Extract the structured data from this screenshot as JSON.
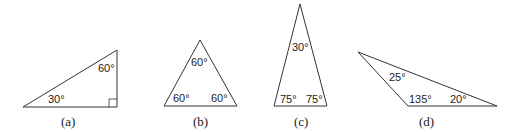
{
  "figures": [
    {
      "caption": "(a)",
      "angles": [
        "60°",
        "30°"
      ],
      "right_angle_marker": true
    },
    {
      "caption": "(b)",
      "angles": [
        "60°",
        "60°",
        "60°"
      ]
    },
    {
      "caption": "(c)",
      "angles": [
        "30°",
        "75°",
        "75°"
      ]
    },
    {
      "caption": "(d)",
      "angles": [
        "25°",
        "135°",
        "20°"
      ]
    }
  ],
  "colors": {
    "stroke": "#333333",
    "text": "#222222"
  }
}
